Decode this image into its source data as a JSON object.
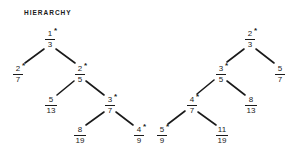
{
  "title": "HIERARCHY",
  "nodes": [
    {
      "id": "n1",
      "num": "1",
      "den": "3",
      "star": "*",
      "x": 50,
      "y": 30
    },
    {
      "id": "n2",
      "num": "2",
      "den": "7",
      "star": "*",
      "x": 18,
      "y": 65
    },
    {
      "id": "n3",
      "num": "2",
      "den": "5",
      "star": "*",
      "x": 80,
      "y": 65
    },
    {
      "id": "n4",
      "num": "5",
      "den": "13",
      "star": "",
      "x": 51,
      "y": 96
    },
    {
      "id": "n5",
      "num": "3",
      "den": "7",
      "star": "*",
      "x": 110,
      "y": 96
    },
    {
      "id": "n6",
      "num": "8",
      "den": "19",
      "star": "",
      "x": 80,
      "y": 126
    },
    {
      "id": "n7",
      "num": "4",
      "den": "9",
      "star": "*",
      "x": 139,
      "y": 126
    },
    {
      "id": "n8",
      "num": "2",
      "den": "3",
      "star": "*",
      "x": 250,
      "y": 30
    },
    {
      "id": "n9",
      "num": "3",
      "den": "5",
      "star": "*",
      "x": 221,
      "y": 65
    },
    {
      "id": "n10",
      "num": "5",
      "den": "7",
      "star": "",
      "x": 280,
      "y": 65
    },
    {
      "id": "n11",
      "num": "4",
      "den": "7",
      "star": "*",
      "x": 192,
      "y": 96
    },
    {
      "id": "n12",
      "num": "8",
      "den": "13",
      "star": "",
      "x": 251,
      "y": 96
    },
    {
      "id": "n13",
      "num": "5",
      "den": "9",
      "star": "*",
      "x": 162,
      "y": 126
    },
    {
      "id": "n14",
      "num": "11",
      "den": "19",
      "star": "",
      "x": 222,
      "y": 126
    }
  ],
  "edges": [
    [
      "1/3",
      "2/7"
    ],
    [
      "1/3",
      "2/5"
    ],
    [
      "2/5",
      "5/13"
    ],
    [
      "2/5",
      "3/7"
    ],
    [
      "3/7",
      "8/19"
    ],
    [
      "3/7",
      "4/9"
    ],
    [
      "2/3",
      "3/5"
    ],
    [
      "2/3",
      "5/7"
    ],
    [
      "3/5",
      "4/7"
    ],
    [
      "3/5",
      "8/13"
    ],
    [
      "4/7",
      "5/9"
    ],
    [
      "4/7",
      "11/19"
    ]
  ]
}
